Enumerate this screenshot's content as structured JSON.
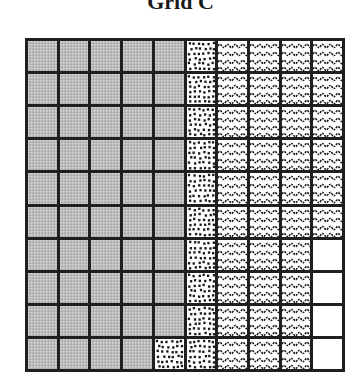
{
  "title": "Grid C",
  "legend_patterns": {
    "gray": "light gray stippled fill",
    "dotted": "black square dots on white",
    "wavy": "wavy black lines on white",
    "white": "blank white"
  },
  "grid": {
    "rows": 10,
    "cols": 10,
    "cells": [
      [
        "gray",
        "gray",
        "gray",
        "gray",
        "gray",
        "dotted",
        "wavy",
        "wavy",
        "wavy",
        "wavy"
      ],
      [
        "gray",
        "gray",
        "gray",
        "gray",
        "gray",
        "dotted",
        "wavy",
        "wavy",
        "wavy",
        "wavy"
      ],
      [
        "gray",
        "gray",
        "gray",
        "gray",
        "gray",
        "dotted",
        "wavy",
        "wavy",
        "wavy",
        "wavy"
      ],
      [
        "gray",
        "gray",
        "gray",
        "gray",
        "gray",
        "dotted",
        "wavy",
        "wavy",
        "wavy",
        "wavy"
      ],
      [
        "gray",
        "gray",
        "gray",
        "gray",
        "gray",
        "dotted",
        "wavy",
        "wavy",
        "wavy",
        "wavy"
      ],
      [
        "gray",
        "gray",
        "gray",
        "gray",
        "gray",
        "dotted",
        "wavy",
        "wavy",
        "wavy",
        "wavy"
      ],
      [
        "gray",
        "gray",
        "gray",
        "gray",
        "gray",
        "dotted",
        "wavy",
        "wavy",
        "wavy",
        "white"
      ],
      [
        "gray",
        "gray",
        "gray",
        "gray",
        "gray",
        "dotted",
        "wavy",
        "wavy",
        "wavy",
        "white"
      ],
      [
        "gray",
        "gray",
        "gray",
        "gray",
        "gray",
        "dotted",
        "wavy",
        "wavy",
        "wavy",
        "white"
      ],
      [
        "gray",
        "gray",
        "gray",
        "gray",
        "dotted",
        "dotted",
        "wavy",
        "wavy",
        "wavy",
        "white"
      ]
    ],
    "counts": {
      "gray": 49,
      "dotted": 11,
      "wavy": 36,
      "white": 4
    }
  },
  "colors": {
    "grid_line": "#1f1f1f",
    "gray_fill": "#bcbcbc",
    "pattern_ink": "#1a1a1a",
    "background": "#ffffff"
  }
}
